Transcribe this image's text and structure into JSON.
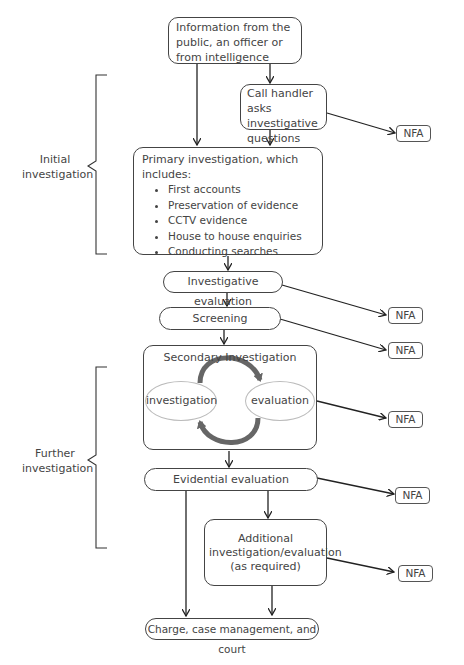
{
  "diagram": {
    "nodes": {
      "info_source": "Information from the public, an officer or from intelligence",
      "call_handler": "Call handler asks investigative questions",
      "primary_investigation": {
        "title": "Primary investigation, which includes:",
        "items": [
          "First accounts",
          "Preservation of evidence",
          "CCTV evidence",
          "House to house enquiries",
          "Conducting searches"
        ]
      },
      "investigative_evaluation": "Investigative evaluation",
      "screening": "Screening",
      "secondary_investigation": {
        "title": "Secondary Investigation",
        "cycle_left": "investigation",
        "cycle_right": "evaluation"
      },
      "evidential_evaluation": "Evidential evaluation",
      "additional": "Additional investigation/evaluation (as required)",
      "charge": "Charge, case management, and court"
    },
    "nfa_label": "NFA",
    "nfa_count": 6,
    "braces": {
      "initial": "Initial investigation",
      "further": "Further investigation"
    },
    "colors": {
      "line": "#222222",
      "box_border": "#444444",
      "cycle_arrow": "#666666",
      "ellipse_border": "#bbbbbb"
    }
  }
}
